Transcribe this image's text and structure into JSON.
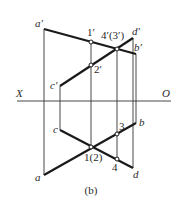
{
  "caption": "(b)",
  "axis": {
    "left_label": "X",
    "right_label": "O"
  },
  "labels": {
    "a_prime": "a′",
    "b_prime": "b′",
    "c_prime": "c′",
    "d_prime": "d′",
    "p1_prime": "1′",
    "p2_prime": "2′",
    "p43_prime": "4′(3′)",
    "a": "a",
    "b": "b",
    "c": "c",
    "d": "d",
    "p12": "1(2)",
    "p3": "3",
    "p4": "4"
  },
  "colors": {
    "line": "#1a1a1a",
    "background": "#ffffff"
  }
}
